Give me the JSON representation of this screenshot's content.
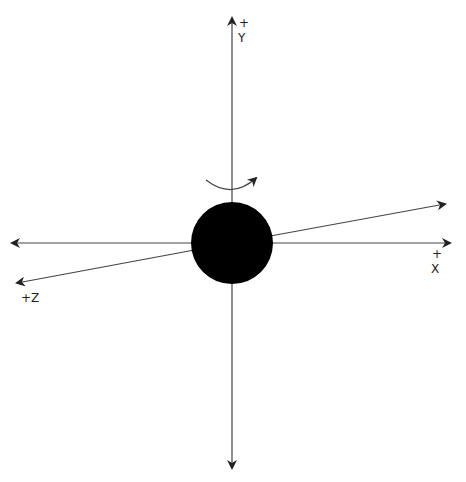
{
  "diagram": {
    "type": "3d-axes",
    "axes": {
      "y": {
        "sign": "+",
        "label": "Y"
      },
      "x": {
        "sign": "+",
        "label": "X"
      },
      "z": {
        "label": "+Z"
      }
    },
    "rotation_arrow": "rotation about Y axis",
    "center_object": "sphere",
    "colors": {
      "line": "#333333",
      "sphere": "#000000",
      "background": "#ffffff"
    }
  }
}
